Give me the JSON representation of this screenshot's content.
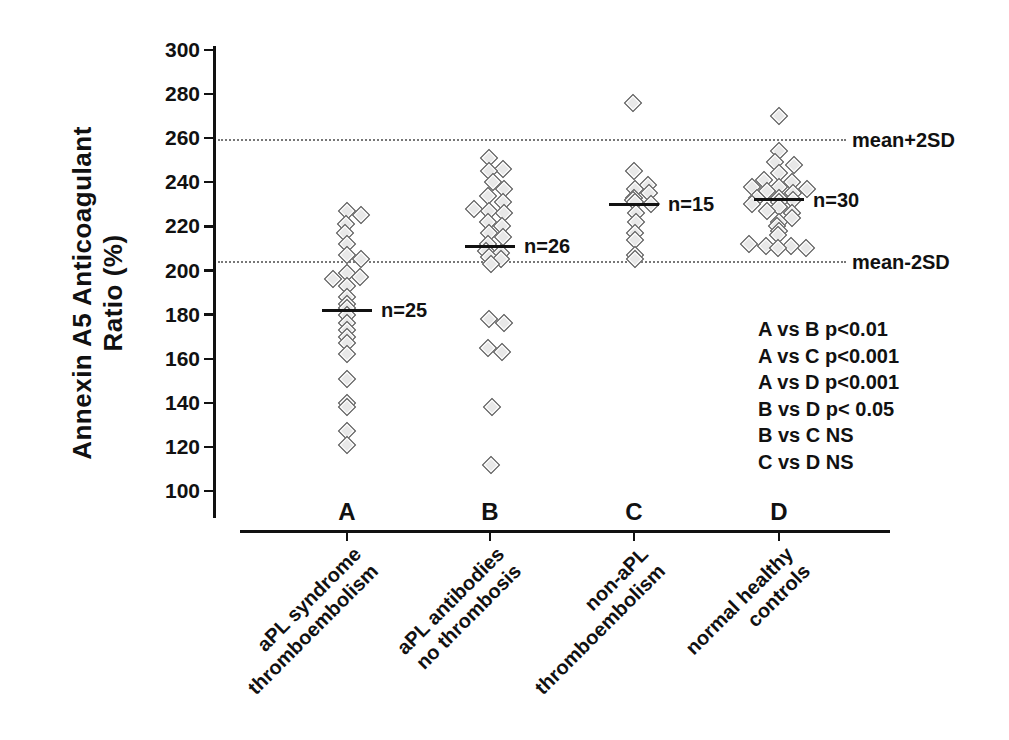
{
  "chart_data": {
    "type": "scatter",
    "title": "",
    "ylabel_line1": "Annexin A5 Anticoagulant",
    "ylabel_line2": "Ratio (%)",
    "xlabel": "",
    "y_ticks": [
      300,
      280,
      260,
      240,
      220,
      200,
      180,
      160,
      140,
      120,
      100
    ],
    "y_range": [
      95,
      307
    ],
    "grid": "off",
    "reference_lines": [
      {
        "value": 259,
        "label": "mean+2SD"
      },
      {
        "value": 204,
        "label": "mean-2SD"
      }
    ],
    "groups": [
      {
        "id": "A",
        "tick_label": "A",
        "category_line1": "aPL syndrome",
        "category_line2": "thromboembolism",
        "n": 25,
        "n_label": "n=25",
        "mean": 182,
        "points": [
          {
            "v": 227,
            "dx": 0
          },
          {
            "v": 225,
            "dx": 14
          },
          {
            "v": 221,
            "dx": -1
          },
          {
            "v": 217,
            "dx": -2
          },
          {
            "v": 212,
            "dx": 0
          },
          {
            "v": 207,
            "dx": 0
          },
          {
            "v": 205,
            "dx": 14
          },
          {
            "v": 199,
            "dx": 0
          },
          {
            "v": 197,
            "dx": 13
          },
          {
            "v": 196,
            "dx": -14
          },
          {
            "v": 193,
            "dx": 0
          },
          {
            "v": 188,
            "dx": 0
          },
          {
            "v": 185,
            "dx": 0
          },
          {
            "v": 183,
            "dx": 0
          },
          {
            "v": 180,
            "dx": 0
          },
          {
            "v": 176,
            "dx": 0
          },
          {
            "v": 173,
            "dx": 0
          },
          {
            "v": 170,
            "dx": 0
          },
          {
            "v": 167,
            "dx": 0
          },
          {
            "v": 162,
            "dx": 0
          },
          {
            "v": 151,
            "dx": 0
          },
          {
            "v": 140,
            "dx": 0
          },
          {
            "v": 138,
            "dx": 0
          },
          {
            "v": 127,
            "dx": 0
          },
          {
            "v": 121,
            "dx": 0
          }
        ]
      },
      {
        "id": "B",
        "tick_label": "B",
        "category_line1": "aPL antibodies",
        "category_line2": "no thrombosis",
        "n": 26,
        "n_label": "n=26",
        "mean": 211,
        "points": [
          {
            "v": 251,
            "dx": -1
          },
          {
            "v": 246,
            "dx": 13
          },
          {
            "v": 245,
            "dx": -1
          },
          {
            "v": 240,
            "dx": 3
          },
          {
            "v": 237,
            "dx": 14
          },
          {
            "v": 234,
            "dx": -2
          },
          {
            "v": 231,
            "dx": 13
          },
          {
            "v": 228,
            "dx": -16
          },
          {
            "v": 227,
            "dx": -1
          },
          {
            "v": 226,
            "dx": 14
          },
          {
            "v": 222,
            "dx": -2
          },
          {
            "v": 220,
            "dx": 12
          },
          {
            "v": 217,
            "dx": -1
          },
          {
            "v": 215,
            "dx": 13
          },
          {
            "v": 212,
            "dx": -2
          },
          {
            "v": 209,
            "dx": -4
          },
          {
            "v": 208,
            "dx": 11
          },
          {
            "v": 206,
            "dx": -1
          },
          {
            "v": 205,
            "dx": 11
          },
          {
            "v": 203,
            "dx": 1
          },
          {
            "v": 178,
            "dx": -1
          },
          {
            "v": 176,
            "dx": 14
          },
          {
            "v": 165,
            "dx": -2
          },
          {
            "v": 163,
            "dx": 12
          },
          {
            "v": 138,
            "dx": 2
          },
          {
            "v": 112,
            "dx": 1
          }
        ]
      },
      {
        "id": "C",
        "tick_label": "C",
        "category_line1": "non-aPL",
        "category_line2": "thromboembolism",
        "n": 15,
        "n_label": "n=15",
        "mean": 230,
        "points": [
          {
            "v": 276,
            "dx": -1
          },
          {
            "v": 245,
            "dx": 0
          },
          {
            "v": 239,
            "dx": 14
          },
          {
            "v": 237,
            "dx": 1
          },
          {
            "v": 235,
            "dx": 15
          },
          {
            "v": 233,
            "dx": 0
          },
          {
            "v": 232,
            "dx": -1
          },
          {
            "v": 231,
            "dx": 1
          },
          {
            "v": 230,
            "dx": 17
          },
          {
            "v": 226,
            "dx": 2
          },
          {
            "v": 222,
            "dx": 2
          },
          {
            "v": 217,
            "dx": 1
          },
          {
            "v": 214,
            "dx": 1
          },
          {
            "v": 207,
            "dx": 1
          },
          {
            "v": 205,
            "dx": 1
          }
        ]
      },
      {
        "id": "D",
        "tick_label": "D",
        "category_line1": "normal healthy",
        "category_line2": "controls",
        "n": 30,
        "n_label": "n=30",
        "mean": 232,
        "points": [
          {
            "v": 270,
            "dx": 0
          },
          {
            "v": 254,
            "dx": 0
          },
          {
            "v": 249,
            "dx": -4
          },
          {
            "v": 248,
            "dx": 15
          },
          {
            "v": 244,
            "dx": 0
          },
          {
            "v": 241,
            "dx": -15
          },
          {
            "v": 240,
            "dx": 13
          },
          {
            "v": 238,
            "dx": -27
          },
          {
            "v": 238,
            "dx": 0
          },
          {
            "v": 237,
            "dx": 28
          },
          {
            "v": 236,
            "dx": -12
          },
          {
            "v": 235,
            "dx": 14
          },
          {
            "v": 233,
            "dx": -22
          },
          {
            "v": 233,
            "dx": 0
          },
          {
            "v": 232,
            "dx": 14
          },
          {
            "v": 231,
            "dx": 0
          },
          {
            "v": 230,
            "dx": -27
          },
          {
            "v": 229,
            "dx": 0
          },
          {
            "v": 227,
            "dx": -12
          },
          {
            "v": 226,
            "dx": 13
          },
          {
            "v": 224,
            "dx": 13
          },
          {
            "v": 222,
            "dx": 0
          },
          {
            "v": 220,
            "dx": -2
          },
          {
            "v": 218,
            "dx": 0
          },
          {
            "v": 216,
            "dx": -1
          },
          {
            "v": 212,
            "dx": -30
          },
          {
            "v": 211,
            "dx": -13
          },
          {
            "v": 211,
            "dx": 12
          },
          {
            "v": 210,
            "dx": -1
          },
          {
            "v": 210,
            "dx": 27
          }
        ]
      }
    ],
    "stats_annotations": [
      "A vs B p<0.01",
      "A vs C p<0.001",
      "A vs D p<0.001",
      "B vs D p< 0.05",
      "B vs C NS",
      "C vs D NS"
    ],
    "marker": {
      "shape": "diamond",
      "fill": "#e8e8e8",
      "border": "#515151"
    },
    "colors": {
      "axis": "#111111",
      "text": "#111111",
      "dotted_line": "#777777"
    },
    "legend": "none"
  }
}
